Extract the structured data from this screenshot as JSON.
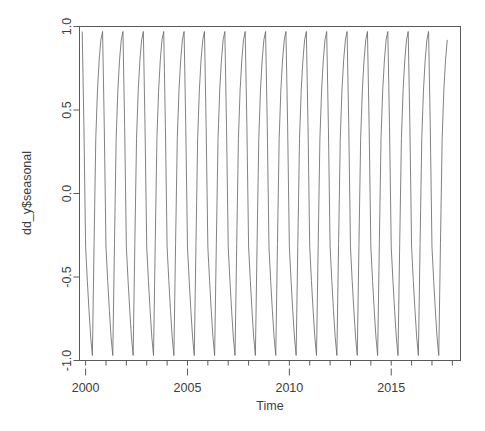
{
  "chart_data": {
    "type": "line",
    "title": "",
    "subtitle": "",
    "xlabel": "Time",
    "ylabel": "dd_y$seasonal",
    "grid": false,
    "legend": "none",
    "xlim": [
      1999.7,
      2018.4
    ],
    "ylim": [
      -1.0,
      1.0
    ],
    "x_ticks": [
      2000,
      2005,
      2010,
      2015
    ],
    "x_tick_labels": [
      "2000",
      "2005",
      "2010",
      "2015"
    ],
    "x_minor_tick_step": 1,
    "y_ticks": [
      -1.0,
      -0.5,
      0.0,
      0.5,
      1.0
    ],
    "y_tick_labels": [
      "-1.0",
      "-0.5",
      "0.0",
      "0.5",
      "1.0"
    ],
    "series_name": "dd_y$seasonal",
    "line_color": "#6b6b6b",
    "frequency_per_year": 12,
    "period_years": 1,
    "n_points": 216,
    "x_start": 1999.833,
    "x_end": 2017.75,
    "seasonal_cycle_months": [
      "Jan",
      "Feb",
      "Mar",
      "Apr",
      "May",
      "Jun",
      "Jul",
      "Aug",
      "Sep",
      "Oct",
      "Nov",
      "Dec"
    ],
    "seasonal_cycle_values": [
      -0.32,
      -0.52,
      -0.7,
      -0.86,
      -0.97,
      -0.3,
      0.33,
      0.62,
      0.8,
      0.92,
      0.97,
      0.4
    ],
    "note": "Repeating annual seasonal component, amplitude approximately -0.97 to 0.97"
  },
  "axis": {
    "y_label": "dd_y$seasonal",
    "x_label": "Time"
  }
}
